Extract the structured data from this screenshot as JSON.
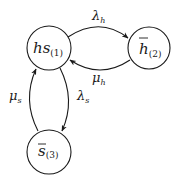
{
  "diagram": {
    "type": "state-transition",
    "nodes": [
      {
        "id": "1",
        "base": "hs",
        "overline": false,
        "sub": "(1)",
        "cx": 49,
        "cy": 48,
        "r": 22
      },
      {
        "id": "2",
        "base": "h",
        "overline": true,
        "sub": "(2)",
        "cx": 149,
        "cy": 48,
        "r": 21
      },
      {
        "id": "3",
        "base": "s",
        "overline": true,
        "sub": "(3)",
        "cx": 49,
        "cy": 152,
        "r": 22
      }
    ],
    "edges": [
      {
        "from": "1",
        "to": "2",
        "label_base": "λ",
        "label_sub": "h"
      },
      {
        "from": "2",
        "to": "1",
        "label_base": "μ",
        "label_sub": "h"
      },
      {
        "from": "1",
        "to": "3",
        "label_base": "λ",
        "label_sub": "s"
      },
      {
        "from": "3",
        "to": "1",
        "label_base": "μ",
        "label_sub": "s"
      }
    ],
    "colors": {
      "stroke": "#1a1a1a",
      "background": "#ffffff"
    }
  }
}
